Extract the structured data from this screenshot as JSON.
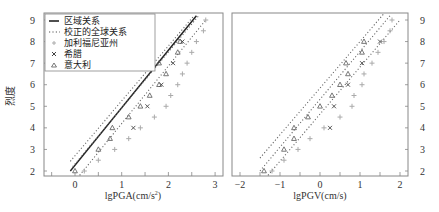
{
  "chart_data": [
    {
      "type": "scatter",
      "title": "",
      "xlabel": "lgPGA(cm/s²)",
      "ylabel": "烈度",
      "xlim": [
        -0.65,
        3.1
      ],
      "ylim": [
        1.8,
        9.2
      ],
      "xticks": [
        0,
        1,
        2,
        3
      ],
      "yticks": [
        2,
        3,
        4,
        5,
        6,
        7,
        8,
        9
      ],
      "grid": false,
      "legend_position": "upper left",
      "legend": [
        "区域关系",
        "校正的全球关系",
        "加利福尼亚州",
        "希腊",
        "意大利"
      ],
      "lines": [
        {
          "name": "区域关系",
          "style": "solid",
          "points": [
            [
              -0.1,
              2.0
            ],
            [
              2.6,
              9.2
            ]
          ]
        },
        {
          "name": "校正的全球关系 (upper)",
          "style": "dotted",
          "points": [
            [
              -0.1,
              2.45
            ],
            [
              2.55,
              9.2
            ]
          ]
        },
        {
          "name": "校正的全球关系 (middle)",
          "style": "dotted",
          "points": [
            [
              -0.05,
              2.2
            ],
            [
              2.65,
              9.2
            ]
          ]
        },
        {
          "name": "校正的全球关系 (lower)",
          "style": "dotted",
          "points": [
            [
              0.1,
              1.8
            ],
            [
              2.8,
              9.0
            ]
          ]
        }
      ],
      "series": [
        {
          "name": "加利福尼亚州",
          "marker": "+",
          "points": [
            [
              0.2,
              2.0
            ],
            [
              0.5,
              2.5
            ],
            [
              0.85,
              3.0
            ],
            [
              1.15,
              3.5
            ],
            [
              1.4,
              4.0
            ],
            [
              1.7,
              4.5
            ],
            [
              1.95,
              5.0
            ],
            [
              2.05,
              5.5
            ],
            [
              2.2,
              6.0
            ],
            [
              2.3,
              6.5
            ],
            [
              2.4,
              7.0
            ],
            [
              2.5,
              7.5
            ],
            [
              2.6,
              8.0
            ],
            [
              2.75,
              8.5
            ],
            [
              2.8,
              9.0
            ]
          ]
        },
        {
          "name": "希腊",
          "marker": "x",
          "points": [
            [
              1.25,
              4.0
            ],
            [
              1.55,
              5.0
            ],
            [
              1.85,
              6.0
            ],
            [
              2.1,
              7.0
            ],
            [
              2.3,
              8.0
            ]
          ]
        },
        {
          "name": "意大利",
          "marker": "triangle",
          "points": [
            [
              0.0,
              2.0
            ],
            [
              0.5,
              3.0
            ],
            [
              0.75,
              3.5
            ],
            [
              0.8,
              4.0
            ],
            [
              1.15,
              4.5
            ],
            [
              1.4,
              5.0
            ],
            [
              1.6,
              5.5
            ],
            [
              1.8,
              6.0
            ],
            [
              1.95,
              6.5
            ],
            [
              1.8,
              7.0
            ],
            [
              2.2,
              7.5
            ],
            [
              2.25,
              8.0
            ]
          ]
        }
      ]
    },
    {
      "type": "scatter",
      "title": "",
      "xlabel": "lgPGV(cm/s)",
      "ylabel": "",
      "xlim": [
        -2.2,
        2.25
      ],
      "ylim": [
        1.8,
        9.2
      ],
      "xticks": [
        -2,
        -1,
        0,
        1,
        2
      ],
      "yticks": [
        2,
        3,
        4,
        5,
        6,
        7,
        8,
        9
      ],
      "grid": false,
      "lines": [
        {
          "name": "校正的全球关系 (upper)",
          "style": "dotted",
          "points": [
            [
              -1.5,
              2.6
            ],
            [
              1.6,
              9.3
            ]
          ]
        },
        {
          "name": "校正的全球关系 (middle)",
          "style": "dotted",
          "points": [
            [
              -1.5,
              2.0
            ],
            [
              1.75,
              9.2
            ]
          ]
        },
        {
          "name": "校正的全球关系 (lower)",
          "style": "dotted",
          "points": [
            [
              -1.3,
              1.8
            ],
            [
              2.0,
              9.0
            ]
          ]
        }
      ],
      "series": [
        {
          "name": "加利福尼亚州",
          "marker": "+",
          "points": [
            [
              -1.2,
              2.0
            ],
            [
              -0.9,
              2.5
            ],
            [
              -0.55,
              3.0
            ],
            [
              -0.25,
              3.5
            ],
            [
              0.1,
              4.0
            ],
            [
              0.5,
              4.5
            ],
            [
              0.8,
              5.0
            ],
            [
              0.85,
              5.5
            ],
            [
              1.05,
              6.0
            ],
            [
              1.1,
              6.5
            ],
            [
              1.3,
              7.0
            ],
            [
              1.45,
              7.5
            ],
            [
              1.6,
              8.0
            ],
            [
              1.75,
              8.5
            ],
            [
              1.8,
              9.0
            ]
          ]
        },
        {
          "name": "希腊",
          "marker": "x",
          "points": [
            [
              0.25,
              4.0
            ],
            [
              0.35,
              5.0
            ],
            [
              0.7,
              6.0
            ],
            [
              1.05,
              7.0
            ],
            [
              1.5,
              8.0
            ]
          ]
        },
        {
          "name": "意大利",
          "marker": "triangle",
          "points": [
            [
              -1.4,
              2.0
            ],
            [
              -0.9,
              3.0
            ],
            [
              -0.65,
              3.5
            ],
            [
              -0.65,
              4.0
            ],
            [
              -0.3,
              4.5
            ],
            [
              0.0,
              5.0
            ],
            [
              0.3,
              5.5
            ],
            [
              0.5,
              6.0
            ],
            [
              0.7,
              6.5
            ],
            [
              0.65,
              7.0
            ],
            [
              1.05,
              7.5
            ],
            [
              1.1,
              8.0
            ]
          ]
        }
      ]
    }
  ],
  "left_panel": {
    "ylabel": "烈度",
    "xlabel_main": "lgPGA(cm/s",
    "xlabel_sup": "2",
    "xlabel_end": ")",
    "xtick_labels": [
      "0",
      "1",
      "2",
      "3"
    ],
    "ytick_labels": [
      "2",
      "3",
      "4",
      "5",
      "6",
      "7",
      "8",
      "9"
    ]
  },
  "right_panel": {
    "xlabel": "lgPGV(cm/s)",
    "xtick_labels": [
      "−2",
      "−1",
      "0",
      "1",
      "2"
    ],
    "ytick_labels": [
      "2",
      "3",
      "4",
      "5",
      "6",
      "7",
      "8",
      "9"
    ]
  },
  "legend": {
    "items": [
      {
        "label": "区域关系",
        "symbol": "solid-line"
      },
      {
        "label": "校正的全球关系",
        "symbol": "dotted-line"
      },
      {
        "label": "加利福尼亚州",
        "symbol": "plus-marker"
      },
      {
        "label": "希腊",
        "symbol": "x-marker"
      },
      {
        "label": "意大利",
        "symbol": "triangle-marker"
      }
    ]
  },
  "colors": {
    "frame": "#888888",
    "text": "#333333",
    "dotted_dark": "#555555",
    "plus_marker": "#aaaaaa",
    "x_marker": "#444444",
    "triangle_marker": "#555555"
  }
}
